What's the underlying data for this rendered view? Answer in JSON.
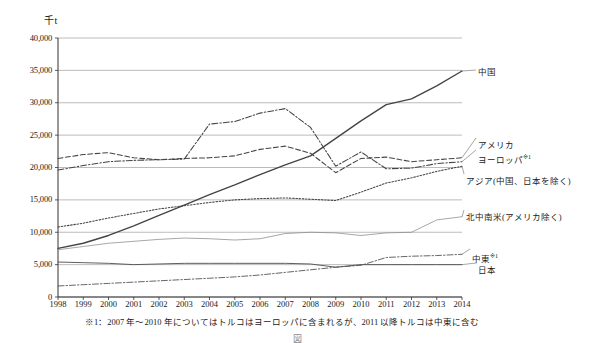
{
  "chart_data": {
    "type": "line",
    "title": "",
    "xlabel": "",
    "ylabel": "千t",
    "unit_label": "千t",
    "x": [
      1998,
      1999,
      2000,
      2001,
      2002,
      2003,
      2004,
      2005,
      2006,
      2007,
      2008,
      2009,
      2010,
      2011,
      2012,
      2013,
      2014
    ],
    "xlim": [
      1998,
      2014
    ],
    "ylim": [
      0,
      40000
    ],
    "ytick_values": [
      0,
      5000,
      10000,
      15000,
      20000,
      25000,
      30000,
      35000,
      40000
    ],
    "ytick_labels": [
      "0",
      "5,000",
      "10,000",
      "15,000",
      "20,000",
      "25,000",
      "30,000",
      "35,000",
      "40,000"
    ],
    "xtick_labels": [
      "1998",
      "1999",
      "2000",
      "2001",
      "2002",
      "2003",
      "2004",
      "2005",
      "2006",
      "2007",
      "2008",
      "2009",
      "2010",
      "2011",
      "2012",
      "2013",
      "2014"
    ],
    "grid": "horizontal",
    "legend_position": "right-inline",
    "series": [
      {
        "name": "中国",
        "label": "中国",
        "style": "solid",
        "color": "#444444",
        "values": [
          7500,
          8300,
          9500,
          11000,
          12600,
          14200,
          15800,
          17300,
          18900,
          20400,
          21800,
          24500,
          27200,
          29700,
          30600,
          32600,
          34900
        ]
      },
      {
        "name": "アメリカ",
        "label": "アメリカ",
        "style": "dashed",
        "color": "#444444",
        "values": [
          21400,
          22000,
          22300,
          21500,
          21200,
          21400,
          21500,
          21800,
          22800,
          23300,
          22200,
          19200,
          21400,
          21600,
          20900,
          21200,
          21500
        ]
      },
      {
        "name": "ヨーロッパ*1",
        "label": "ヨーロッパ",
        "footnote_mark": "※1",
        "style": "dashdot",
        "color": "#444444",
        "values": [
          19600,
          20300,
          20900,
          21100,
          21200,
          21300,
          26700,
          27100,
          28400,
          29100,
          26200,
          20200,
          22400,
          19800,
          19900,
          20600,
          20900
        ]
      },
      {
        "name": "アジア(中国、日本を除く)",
        "label": "アジア(中国、日本を除く)",
        "style": "dotted",
        "color": "#444444",
        "values": [
          10800,
          11400,
          12200,
          12900,
          13600,
          14100,
          14600,
          15000,
          15200,
          15300,
          15100,
          14900,
          16200,
          17600,
          18400,
          19400,
          20200
        ]
      },
      {
        "name": "北中南米(アメリカ除く)",
        "label": "北中南米(アメリカ除く)",
        "style": "solid-thin",
        "color": "#8a8a8a",
        "values": [
          7300,
          7800,
          8300,
          8600,
          8900,
          9100,
          9000,
          8800,
          9000,
          9800,
          10000,
          9900,
          9500,
          9900,
          10000,
          11900,
          12400
        ]
      },
      {
        "name": "中東*1",
        "label": "中東",
        "footnote_mark": "※1",
        "style": "dashdot-thin",
        "color": "#555555",
        "values": [
          1700,
          1900,
          2100,
          2300,
          2500,
          2700,
          2900,
          3100,
          3400,
          3800,
          4200,
          4600,
          4900,
          6100,
          6300,
          6400,
          6600
        ]
      },
      {
        "name": "日本",
        "label": "日本",
        "style": "solid-thin-dark",
        "color": "#555555",
        "values": [
          5400,
          5300,
          5200,
          5000,
          5100,
          5200,
          5200,
          5200,
          5200,
          5200,
          5100,
          4600,
          5000,
          5000,
          5000,
          5000,
          5000
        ]
      }
    ],
    "series_label_positions": [
      {
        "key": "中国",
        "x": 478,
        "y": 67
      },
      {
        "key": "アメリカ",
        "x": 478,
        "y": 140
      },
      {
        "key": "ヨーロッパ",
        "x": 478,
        "y": 152
      },
      {
        "key": "アジア",
        "x": 466,
        "y": 176
      },
      {
        "key": "北中南米",
        "x": 466,
        "y": 212
      },
      {
        "key": "中東",
        "x": 472,
        "y": 251
      },
      {
        "key": "日本",
        "x": 478,
        "y": 265
      }
    ]
  },
  "footnote": {
    "text": "※1：2007 年～2010 年についてはトルコはヨーロッパに含まれるが、2011 以降トルコは中東に含む"
  },
  "caption": {
    "text": "図 　　　 　　 　　 　　 　 　 　 　　 　　 　 　　 　"
  }
}
